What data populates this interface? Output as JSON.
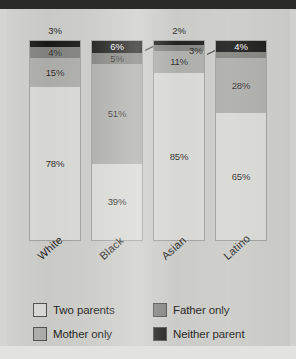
{
  "chart_data": {
    "type": "bar",
    "subtype": "stacked-bar-100",
    "title": "",
    "subtitle": "",
    "xlabel": "",
    "ylabel": "",
    "ylim": [
      0,
      100
    ],
    "grid": false,
    "legend_position": "bottom",
    "orientation": "vertical",
    "value_suffix": "%",
    "categories": [
      "White",
      "Black",
      "Asian",
      "Latino"
    ],
    "series": [
      {
        "name": "Two parents",
        "color": "#d5d5d1",
        "values": [
          78,
          39,
          85,
          65
        ]
      },
      {
        "name": "Mother only",
        "color": "#a9a9a5",
        "values": [
          15,
          51,
          11,
          28
        ]
      },
      {
        "name": "Father only",
        "color": "#7d7d79",
        "values": [
          4,
          5,
          3,
          3
        ]
      },
      {
        "name": "Neither parent",
        "color": "#141412",
        "values": [
          3,
          6,
          2,
          4
        ]
      }
    ],
    "data_labels": {
      "White": {
        "Two parents": "78%",
        "Mother only": "15%",
        "Father only": "4%",
        "Neither parent": "3%"
      },
      "Black": {
        "Two parents": "39%",
        "Mother only": "51%",
        "Father only": "5%",
        "Neither parent": "6%"
      },
      "Asian": {
        "Two parents": "85%",
        "Mother only": "11%",
        "Father only": "3%",
        "Neither parent": "2%"
      },
      "Latino": {
        "Two parents": "65%",
        "Mother only": "28%",
        "Father only": "3%",
        "Neither parent": "4%"
      }
    },
    "label_placement": {
      "White": {
        "Two parents": "inside",
        "Mother only": "inside",
        "Father only": "inside",
        "Neither parent": "above"
      },
      "Black": {
        "Two parents": "inside",
        "Mother only": "inside",
        "Father only": "inside",
        "Neither parent": "inside"
      },
      "Asian": {
        "Two parents": "inside",
        "Mother only": "inside",
        "Father only": "callout-left",
        "Neither parent": "above"
      },
      "Latino": {
        "Two parents": "inside",
        "Mother only": "inside",
        "Father only": "callout-left",
        "Neither parent": "inside"
      }
    }
  },
  "legend": {
    "items": [
      {
        "label": "Two parents",
        "color": "#d5d5d1"
      },
      {
        "label": "Father only",
        "color": "#7d7d79"
      },
      {
        "label": "Mother only",
        "color": "#a9a9a5"
      },
      {
        "label": "Neither parent",
        "color": "#141412"
      }
    ]
  },
  "axis": {
    "category_labels": [
      "White",
      "Black",
      "Asian",
      "Latino"
    ]
  }
}
